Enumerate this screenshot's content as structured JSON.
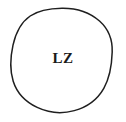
{
  "diagram": {
    "type": "single-node-circle",
    "background_color": "#ffffff",
    "node": {
      "shape": "circle",
      "label": "LZ",
      "label_color": "#1a1a1a",
      "stroke_color": "#1f1f1f",
      "stroke_width": 1.5,
      "fill_color": "#ffffff",
      "center_x": 62,
      "center_y": 60,
      "radius_x": 50,
      "radius_y": 52
    }
  }
}
